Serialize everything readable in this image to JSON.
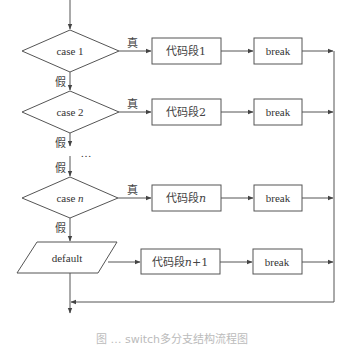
{
  "diagram": {
    "type": "flowchart",
    "colors": {
      "stroke": "#555555",
      "text": "#333333",
      "background": "#ffffff"
    },
    "decisions": [
      {
        "id": "case1",
        "label": "case 1",
        "true_label": "真",
        "false_label": "假"
      },
      {
        "id": "case2",
        "label": "case 2",
        "true_label": "真",
        "false_label": "假"
      },
      {
        "id": "casen",
        "label_prefix": "case ",
        "label_var": "n",
        "true_label": "真",
        "false_label": "假"
      }
    ],
    "ellipsis": "…",
    "ellipsis_false_label": "假",
    "default_node": {
      "label": "default"
    },
    "code_blocks": [
      {
        "label": "代码段1"
      },
      {
        "label": "代码段2"
      },
      {
        "label_prefix": "代码段",
        "label_var": "n"
      },
      {
        "label_prefix": "代码段",
        "label_var": "n",
        "label_suffix": "+1"
      }
    ],
    "break_blocks": [
      {
        "label": "break"
      },
      {
        "label": "break"
      },
      {
        "label": "break"
      },
      {
        "label": "break"
      }
    ],
    "caption": "图 … switch多分支结构流程图"
  }
}
